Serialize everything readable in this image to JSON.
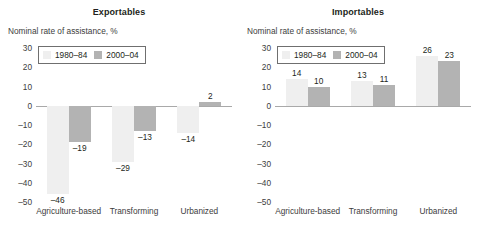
{
  "legend": {
    "entries": [
      {
        "label": "1980–84",
        "color": "#efefef"
      },
      {
        "label": "2000–04",
        "color": "#b3b3b3"
      }
    ]
  },
  "axis_title": "Nominal rate of assistance, %",
  "panels": [
    {
      "title": "Exportables"
    },
    {
      "title": "Importables"
    }
  ],
  "chart_data": [
    {
      "type": "bar",
      "title": "Exportables",
      "xlabel": "",
      "ylabel": "Nominal rate of assistance, %",
      "ylim": [
        -50,
        30
      ],
      "yticks": [
        30,
        20,
        10,
        0,
        -10,
        -20,
        -30,
        -40,
        -50
      ],
      "ytick_labels": [
        "30",
        "20",
        "10",
        "0",
        "–10",
        "–20",
        "–30",
        "–40",
        "–50"
      ],
      "categories": [
        "Agriculture-based",
        "Transforming",
        "Urbanized"
      ],
      "grid": false,
      "legend_position": "top-left",
      "series": [
        {
          "name": "1980–84",
          "color": "#efefef",
          "values": [
            -46,
            -29,
            -14
          ],
          "labels": [
            "–46",
            "–29",
            "–14"
          ]
        },
        {
          "name": "2000–04",
          "color": "#b3b3b3",
          "values": [
            -19,
            -13,
            2
          ],
          "labels": [
            "–19",
            "–13",
            "2"
          ]
        }
      ]
    },
    {
      "type": "bar",
      "title": "Importables",
      "xlabel": "",
      "ylabel": "Nominal rate of assistance, %",
      "ylim": [
        -50,
        30
      ],
      "yticks": [
        30,
        20,
        10,
        0,
        -10,
        -20,
        -30,
        -40,
        -50
      ],
      "ytick_labels": [
        "30",
        "20",
        "10",
        "0",
        "–10",
        "–20",
        "–30",
        "–40",
        "–50"
      ],
      "categories": [
        "Agriculture-based",
        "Transforming",
        "Urbanized"
      ],
      "grid": false,
      "legend_position": "top-left",
      "series": [
        {
          "name": "1980–84",
          "color": "#efefef",
          "values": [
            14,
            13,
            26
          ],
          "labels": [
            "14",
            "13",
            "26"
          ]
        },
        {
          "name": "2000–04",
          "color": "#b3b3b3",
          "values": [
            10,
            11,
            23
          ],
          "labels": [
            "10",
            "11",
            "23"
          ]
        }
      ]
    }
  ]
}
